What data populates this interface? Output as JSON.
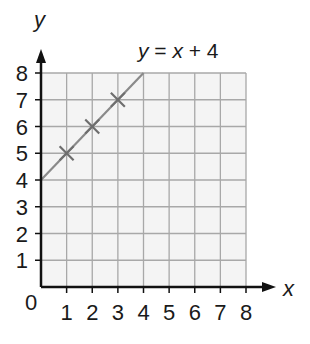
{
  "chart_data": {
    "type": "line",
    "title": "",
    "xlabel": "x",
    "ylabel": "y",
    "origin_label": "0",
    "xlim": [
      0,
      8
    ],
    "ylim": [
      0,
      8
    ],
    "grid": true,
    "x_ticks": [
      "1",
      "2",
      "3",
      "4",
      "5",
      "6",
      "7",
      "8"
    ],
    "y_ticks": [
      "1",
      "2",
      "3",
      "4",
      "5",
      "6",
      "7",
      "8"
    ],
    "series": [
      {
        "name": "y = x + 4",
        "type": "line",
        "x": [
          0,
          4
        ],
        "y": [
          4,
          8
        ],
        "color": "#8a8a8a"
      },
      {
        "name": "points",
        "type": "scatter",
        "marker": "x",
        "x": [
          1,
          2,
          3
        ],
        "y": [
          5,
          6,
          7
        ],
        "color": "#6e6e6e"
      }
    ],
    "annotations": [
      {
        "text_parts": [
          "y",
          " = ",
          "x",
          " + 4"
        ],
        "text": "y = x + 4",
        "position": "top, near line end"
      }
    ],
    "colors": {
      "grid_fill": "#f4f4f4",
      "grid_line": "#a8a8a8",
      "axis": "#111111"
    }
  }
}
